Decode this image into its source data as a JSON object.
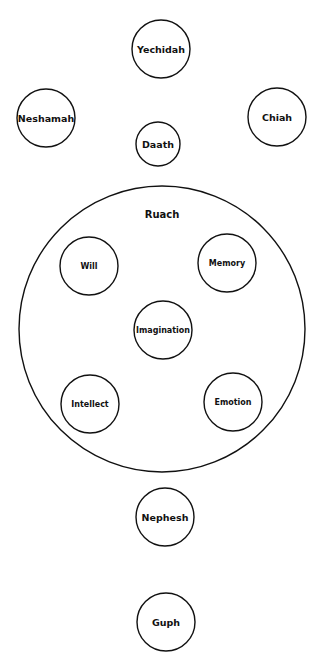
{
  "diagram": {
    "stroke_color": "#111111",
    "background": "#ffffff",
    "container": {
      "label": "Ruach",
      "cx": 162,
      "cy": 329,
      "r": 143,
      "label_x": 162,
      "label_y": 214
    },
    "nodes": [
      {
        "id": "yechidah",
        "label": "Yechidah",
        "cx": 161,
        "cy": 49,
        "r": 29,
        "font": 9.5
      },
      {
        "id": "neshamah",
        "label": "Neshamah",
        "cx": 46,
        "cy": 118,
        "r": 29,
        "font": 9.5
      },
      {
        "id": "chiah",
        "label": "Chiah",
        "cx": 277,
        "cy": 117,
        "r": 29,
        "font": 9.5
      },
      {
        "id": "daath",
        "label": "Daath",
        "cx": 158,
        "cy": 144,
        "r": 22,
        "font": 9.5
      },
      {
        "id": "will",
        "label": "Will",
        "cx": 89,
        "cy": 266,
        "r": 29,
        "font": 8
      },
      {
        "id": "memory",
        "label": "Memory",
        "cx": 227,
        "cy": 263,
        "r": 29,
        "font": 8
      },
      {
        "id": "imagination",
        "label": "Imagination",
        "cx": 163,
        "cy": 330,
        "r": 29,
        "font": 8
      },
      {
        "id": "intellect",
        "label": "Intellect",
        "cx": 90,
        "cy": 404,
        "r": 29,
        "font": 8
      },
      {
        "id": "emotion",
        "label": "Emotion",
        "cx": 233,
        "cy": 402,
        "r": 29,
        "font": 8
      },
      {
        "id": "nephesh",
        "label": "Nephesh",
        "cx": 165,
        "cy": 517,
        "r": 29,
        "font": 9.5
      },
      {
        "id": "guph",
        "label": "Guph",
        "cx": 166,
        "cy": 622,
        "r": 29,
        "font": 9.5
      }
    ]
  }
}
